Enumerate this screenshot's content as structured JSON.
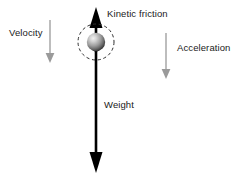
{
  "figure": {
    "type": "free-body-diagram",
    "title": "",
    "background_color": "#ffffff",
    "width": 243,
    "height": 176
  },
  "labels": {
    "velocity": "Velocity",
    "kinetic_friction": "Kinetic friction",
    "acceleration": "Acceleration",
    "weight": "Weight"
  },
  "colors": {
    "text": "#1a1a1a",
    "force_arrow": "#000000",
    "motion_arrow": "#9a9a9a",
    "sphere_light": "#e0e0e0",
    "sphere_dark": "#3d3d3d",
    "dashed_circle": "#333333"
  },
  "vectors": [
    {
      "name": "kinetic-friction",
      "label": "Kinetic friction",
      "direction": "up",
      "color": "#000000",
      "style": "solid-thick",
      "category": "force",
      "x": 96,
      "y_tail": 52,
      "y_head": 8
    },
    {
      "name": "weight",
      "label": "Weight",
      "direction": "down",
      "color": "#000000",
      "style": "solid-thick",
      "category": "force",
      "x": 96,
      "y_tail": 42,
      "y_head": 172
    },
    {
      "name": "velocity",
      "label": "Velocity",
      "direction": "down",
      "color": "#9a9a9a",
      "style": "solid-thin",
      "category": "motion",
      "x": 50,
      "y_tail": 20,
      "y_head": 62
    },
    {
      "name": "acceleration",
      "label": "Acceleration",
      "direction": "down",
      "color": "#9a9a9a",
      "style": "solid-thin",
      "category": "motion",
      "x": 166,
      "y_tail": 33,
      "y_head": 79
    }
  ],
  "objects": [
    {
      "name": "sphere",
      "shape": "shaded-ball",
      "cx": 96,
      "cy": 42,
      "r": 9
    },
    {
      "name": "dashed-circle",
      "shape": "dashed-circle",
      "cx": 96,
      "cy": 42,
      "r": 18
    }
  ]
}
